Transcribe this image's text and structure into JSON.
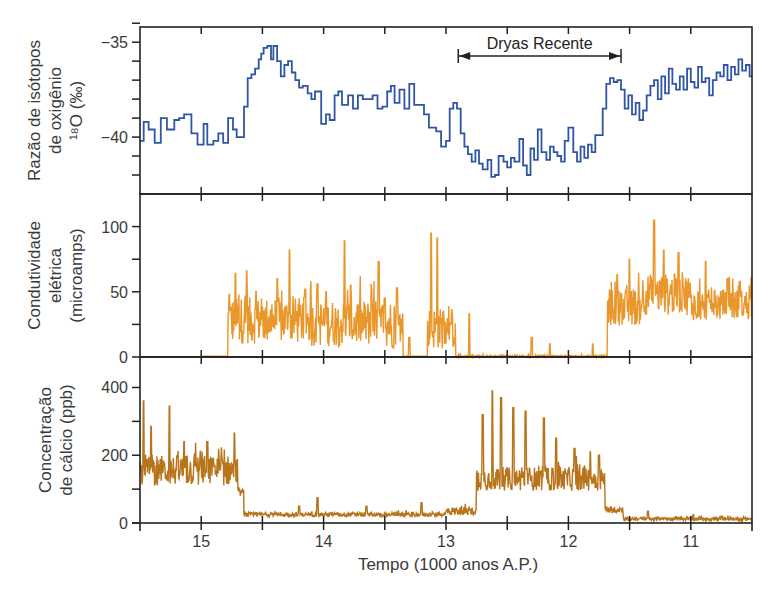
{
  "chart_data": [
    {
      "type": "line",
      "id": "oxygen",
      "ylabel_lines": [
        "Razão de isótopos",
        "de oxigênio",
        "¹⁸O (‰)"
      ],
      "yticks": [
        -35,
        -40
      ],
      "yminor": [
        -34,
        -35,
        -36,
        -37,
        -38,
        -39,
        -40,
        -41,
        -42
      ],
      "ylim": [
        -43,
        -34.2
      ],
      "color": "#2f55a4",
      "step": true,
      "annotation": {
        "label": "Dryas Recente",
        "from": 12.9,
        "to": 11.57,
        "y": -34.9
      },
      "x": [
        15.5,
        15.47,
        15.43,
        15.38,
        15.33,
        15.28,
        15.22,
        15.18,
        15.14,
        15.08,
        15.03,
        14.98,
        14.95,
        14.9,
        14.86,
        14.82,
        14.78,
        14.74,
        14.71,
        14.68,
        14.65,
        14.62,
        14.59,
        14.56,
        14.53,
        14.51,
        14.49,
        14.46,
        14.43,
        14.41,
        14.38,
        14.35,
        14.32,
        14.29,
        14.26,
        14.23,
        14.2,
        14.17,
        14.13,
        14.1,
        14.07,
        14.02,
        13.98,
        13.95,
        13.91,
        13.88,
        13.85,
        13.8,
        13.76,
        13.72,
        13.68,
        13.64,
        13.6,
        13.56,
        13.52,
        13.48,
        13.45,
        13.42,
        13.38,
        13.34,
        13.3,
        13.26,
        13.22,
        13.18,
        13.14,
        13.12,
        13.08,
        13.04,
        13.0,
        12.97,
        12.94,
        12.91,
        12.88,
        12.85,
        12.82,
        12.79,
        12.76,
        12.73,
        12.7,
        12.66,
        12.63,
        12.6,
        12.57,
        12.53,
        12.5,
        12.47,
        12.44,
        12.4,
        12.37,
        12.34,
        12.31,
        12.28,
        12.25,
        12.22,
        12.18,
        12.15,
        12.12,
        12.09,
        12.06,
        12.03,
        12.0,
        11.96,
        11.93,
        11.9,
        11.87,
        11.84,
        11.81,
        11.78,
        11.75,
        11.72,
        11.69,
        11.66,
        11.63,
        11.6,
        11.57,
        11.54,
        11.51,
        11.48,
        11.45,
        11.42,
        11.39,
        11.36,
        11.33,
        11.3,
        11.27,
        11.24,
        11.21,
        11.18,
        11.15,
        11.12,
        11.09,
        11.06,
        11.03,
        11.0,
        10.97,
        10.94,
        10.91,
        10.88,
        10.85,
        10.82,
        10.79,
        10.76,
        10.73,
        10.7,
        10.67,
        10.64,
        10.61,
        10.58,
        10.55,
        10.52
      ],
      "values": [
        -40.2,
        -39.2,
        -39.6,
        -40.3,
        -39.0,
        -39.6,
        -39.1,
        -39.0,
        -38.8,
        -39.8,
        -40.4,
        -39.3,
        -40.4,
        -40.2,
        -39.8,
        -40.3,
        -39.0,
        -39.6,
        -40.0,
        -40.0,
        -38.4,
        -36.9,
        -36.7,
        -36.4,
        -35.9,
        -35.6,
        -35.3,
        -35.2,
        -35.9,
        -35.2,
        -36.0,
        -36.8,
        -36.2,
        -36.0,
        -36.6,
        -37.0,
        -37.4,
        -37.3,
        -37.7,
        -38.0,
        -37.6,
        -39.3,
        -38.8,
        -39.1,
        -37.8,
        -37.6,
        -38.3,
        -37.8,
        -38.5,
        -37.8,
        -38.0,
        -38.0,
        -37.8,
        -38.5,
        -38.4,
        -37.6,
        -37.3,
        -38.2,
        -37.5,
        -38.5,
        -37.2,
        -38.3,
        -38.3,
        -38.8,
        -39.5,
        -39.5,
        -39.7,
        -40.5,
        -40.2,
        -38.5,
        -38.2,
        -38.5,
        -39.8,
        -40.5,
        -40.9,
        -41.3,
        -40.7,
        -41.4,
        -41.7,
        -41.2,
        -42.1,
        -42.0,
        -41.0,
        -41.3,
        -41.6,
        -41.1,
        -41.3,
        -40.1,
        -41.5,
        -42.0,
        -40.6,
        -41.2,
        -39.6,
        -40.8,
        -41.2,
        -40.5,
        -40.8,
        -41.0,
        -41.3,
        -40.2,
        -39.5,
        -40.8,
        -41.3,
        -40.5,
        -41.1,
        -40.4,
        -40.8,
        -39.9,
        -39.9,
        -38.5,
        -37.2,
        -36.9,
        -37.1,
        -37.0,
        -37.5,
        -38.5,
        -37.8,
        -38.8,
        -38.2,
        -39.1,
        -38.6,
        -37.8,
        -37.3,
        -37.0,
        -38.0,
        -36.8,
        -37.7,
        -36.4,
        -37.2,
        -37.5,
        -36.8,
        -37.5,
        -36.4,
        -37.1,
        -37.4,
        -36.3,
        -37.1,
        -36.9,
        -37.8,
        -37.0,
        -36.6,
        -36.8,
        -36.2,
        -37.0,
        -36.3,
        -36.7,
        -35.9,
        -36.5,
        -36.2,
        -36.8,
        -36.6
      ]
    },
    {
      "type": "line",
      "id": "conductivity",
      "ylabel_lines": [
        "Condutividade",
        "elétrica",
        "(microamps)"
      ],
      "yticks": [
        0,
        50,
        100
      ],
      "yminor": [
        0,
        25,
        50,
        75,
        100
      ],
      "ylim": [
        0,
        125
      ],
      "color": "#e9962a",
      "segments": [
        {
          "from": 15.5,
          "to": 15.0,
          "level": 0,
          "noise": 0
        },
        {
          "from": 15.0,
          "to": 14.78,
          "level": 0.5,
          "noise": 0,
          "spikes": [
            [
              15.02,
              28
            ]
          ]
        },
        {
          "from": 14.78,
          "to": 14.1,
          "level": 28,
          "noise": 18,
          "spikes": [
            [
              14.77,
              48
            ],
            [
              14.72,
              64
            ],
            [
              14.63,
              66
            ],
            [
              14.55,
              50
            ],
            [
              14.38,
              60
            ],
            [
              14.28,
              82
            ],
            [
              14.15,
              52
            ]
          ]
        },
        {
          "from": 14.1,
          "to": 13.45,
          "level": 26,
          "noise": 18,
          "spikes": [
            [
              14.05,
              56
            ],
            [
              13.98,
              50
            ],
            [
              13.83,
              89
            ],
            [
              13.78,
              55
            ],
            [
              13.55,
              73
            ],
            [
              13.5,
              45
            ]
          ]
        },
        {
          "from": 13.45,
          "to": 13.35,
          "level": 22,
          "noise": 16,
          "spikes": [
            [
              13.4,
              53
            ]
          ]
        },
        {
          "from": 13.35,
          "to": 13.15,
          "level": 0.5,
          "noise": 0,
          "spikes": [
            [
              13.3,
              15
            ]
          ]
        },
        {
          "from": 13.15,
          "to": 12.92,
          "level": 22,
          "noise": 16,
          "spikes": [
            [
              13.12,
              95
            ],
            [
              13.07,
              91
            ],
            [
              13.02,
              35
            ],
            [
              12.96,
              25
            ]
          ]
        },
        {
          "from": 12.92,
          "to": 11.68,
          "level": 0.5,
          "noise": 0.8,
          "spikes": [
            [
              12.81,
              33
            ],
            [
              12.3,
              15
            ],
            [
              12.15,
              10
            ],
            [
              11.8,
              10
            ]
          ]
        },
        {
          "from": 11.68,
          "to": 11.4,
          "level": 38,
          "noise": 14,
          "spikes": [
            [
              11.6,
              63
            ],
            [
              11.5,
              75
            ]
          ]
        },
        {
          "from": 11.4,
          "to": 11.0,
          "level": 48,
          "noise": 16,
          "spikes": [
            [
              11.3,
              105
            ],
            [
              11.22,
              82
            ],
            [
              11.1,
              80
            ]
          ]
        },
        {
          "from": 11.0,
          "to": 10.5,
          "level": 40,
          "noise": 12,
          "spikes": [
            [
              10.88,
              73
            ],
            [
              10.7,
              60
            ],
            [
              10.6,
              58
            ]
          ]
        }
      ]
    },
    {
      "type": "line",
      "id": "calcium",
      "ylabel_lines": [
        "Concentração",
        "de cálcio (ppb)"
      ],
      "yticks": [
        0,
        200,
        400
      ],
      "yminor": [
        0,
        100,
        200,
        300,
        400
      ],
      "ylim": [
        0,
        490
      ],
      "color": "#b8741a",
      "segments": [
        {
          "from": 15.5,
          "to": 14.7,
          "level": 155,
          "noise": 45,
          "spikes": [
            [
              15.47,
              360
            ],
            [
              15.41,
              285
            ],
            [
              15.26,
              345
            ],
            [
              15.14,
              240
            ],
            [
              14.95,
              240
            ],
            [
              14.73,
              265
            ]
          ]
        },
        {
          "from": 14.7,
          "to": 14.65,
          "level": 90,
          "noise": 10
        },
        {
          "from": 14.65,
          "to": 13.0,
          "level": 25,
          "noise": 6,
          "spikes": [
            [
              14.2,
              50
            ],
            [
              14.05,
              75
            ],
            [
              13.65,
              50
            ],
            [
              13.2,
              60
            ]
          ]
        },
        {
          "from": 13.0,
          "to": 12.75,
          "level": 35,
          "noise": 12
        },
        {
          "from": 12.75,
          "to": 11.7,
          "level": 130,
          "noise": 35,
          "spikes": [
            [
              12.7,
              320
            ],
            [
              12.62,
              390
            ],
            [
              12.55,
              370
            ],
            [
              12.45,
              340
            ],
            [
              12.35,
              330
            ],
            [
              12.2,
              310
            ],
            [
              12.1,
              250
            ],
            [
              11.95,
              220
            ],
            [
              11.82,
              210
            ],
            [
              11.75,
              200
            ]
          ]
        },
        {
          "from": 11.7,
          "to": 11.55,
          "level": 40,
          "noise": 10
        },
        {
          "from": 11.55,
          "to": 10.5,
          "level": 12,
          "noise": 5,
          "spikes": [
            [
              11.35,
              35
            ],
            [
              10.98,
              25
            ],
            [
              10.75,
              20
            ]
          ]
        }
      ]
    }
  ],
  "xaxis": {
    "label": "Tempo (1000 anos A.P.)",
    "ticks": [
      15,
      14,
      13,
      12,
      11
    ],
    "minor": [
      15,
      14.5,
      14,
      13.5,
      13,
      12.5,
      12,
      11.5,
      11
    ],
    "xlim": [
      15.5,
      10.5
    ]
  }
}
